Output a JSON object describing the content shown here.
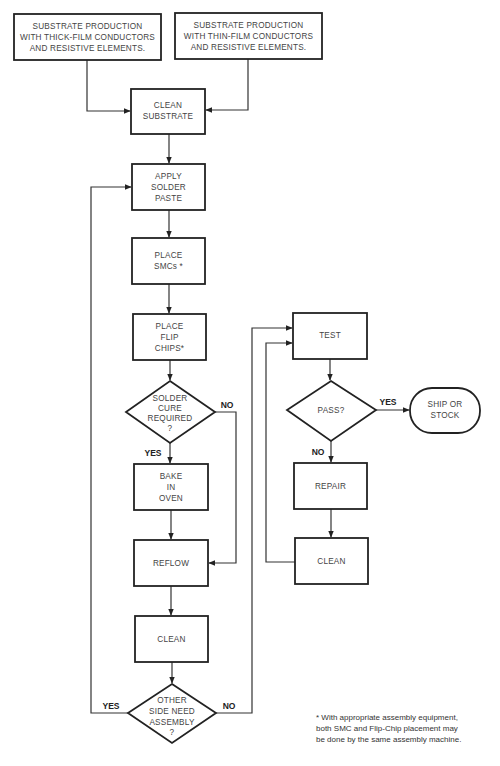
{
  "diagram": {
    "type": "flowchart",
    "nodes": {
      "thick_film": {
        "lines": [
          "SUBSTRATE PRODUCTION",
          "WITH THICK-FILM CONDUCTORS",
          "AND RESISTIVE ELEMENTS."
        ]
      },
      "thin_film": {
        "lines": [
          "SUBSTRATE PRODUCTION",
          "WITH THIN-FILM CONDUCTORS",
          "AND RESISTIVE ELEMENTS."
        ]
      },
      "clean_substrate": {
        "lines": [
          "CLEAN",
          "SUBSTRATE"
        ]
      },
      "apply_paste": {
        "lines": [
          "APPLY",
          "SOLDER",
          "PASTE"
        ]
      },
      "place_smcs": {
        "lines": [
          "PLACE",
          "SMCs *"
        ]
      },
      "place_flip": {
        "lines": [
          "PLACE",
          "FLIP",
          "CHIPS*"
        ]
      },
      "cure_decision": {
        "lines": [
          "SOLDER",
          "CURE",
          "REQUIRED",
          "?"
        ]
      },
      "bake": {
        "lines": [
          "BAKE",
          "IN",
          "OVEN"
        ]
      },
      "reflow": {
        "lines": [
          "REFLOW"
        ]
      },
      "clean_left": {
        "lines": [
          "CLEAN"
        ]
      },
      "other_side_decision": {
        "lines": [
          "OTHER",
          "SIDE NEED",
          "ASSEMBLY",
          "?"
        ]
      },
      "test": {
        "lines": [
          "TEST"
        ]
      },
      "pass_decision": {
        "lines": [
          "PASS?"
        ]
      },
      "ship": {
        "lines": [
          "SHIP OR",
          "STOCK"
        ]
      },
      "repair": {
        "lines": [
          "REPAIR"
        ]
      },
      "clean_right": {
        "lines": [
          "CLEAN"
        ]
      }
    },
    "edge_labels": {
      "cure_yes": "YES",
      "cure_no": "NO",
      "other_yes": "YES",
      "other_no": "NO",
      "pass_yes": "YES",
      "pass_no": "NO"
    },
    "footnote": [
      "* With appropriate assembly equipment,",
      "both SMC and Flip-Chip placement may",
      "be done by the same assembly machine."
    ]
  }
}
